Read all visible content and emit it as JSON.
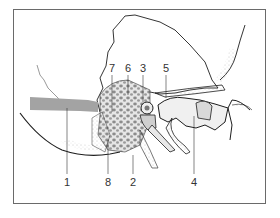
{
  "diagram": {
    "type": "anatomical-illustration",
    "colors": {
      "outline": "#1e1e1e",
      "bone_fill": "#f4f4f4",
      "stipple": "#9a9a9a",
      "canal_band": "#9c9c9c",
      "air_cells": "#8a8a8a",
      "frame": "#6a6a6a",
      "background": "#ffffff"
    },
    "top_labels": [
      {
        "id": "7",
        "text": "7",
        "x": 112,
        "y": 63
      },
      {
        "id": "6",
        "text": "6",
        "x": 128,
        "y": 63
      },
      {
        "id": "3",
        "text": "3",
        "x": 143,
        "y": 63
      },
      {
        "id": "5",
        "text": "5",
        "x": 166,
        "y": 63
      }
    ],
    "bottom_labels": [
      {
        "id": "1",
        "text": "1",
        "x": 67,
        "y": 177
      },
      {
        "id": "8",
        "text": "8",
        "x": 108,
        "y": 177
      },
      {
        "id": "2",
        "text": "2",
        "x": 133,
        "y": 177
      },
      {
        "id": "4",
        "text": "4",
        "x": 194,
        "y": 177
      }
    ]
  }
}
